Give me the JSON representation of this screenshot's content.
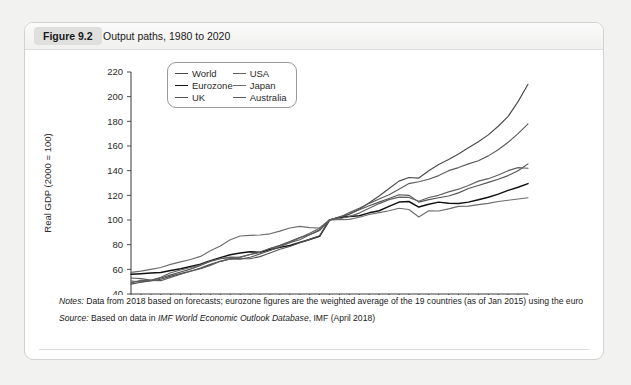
{
  "figure": {
    "badge": "Figure 9.2",
    "title": "Output paths, 1980 to 2020"
  },
  "notes": {
    "notes_label": "Notes:",
    "notes_text": " Data from 2018 based on forecasts; eurozone figures are the weighted average of the 19 countries (as of Jan 2015) using the euro",
    "source_label": "Source:",
    "source_prefix": " Based on data in ",
    "source_italic": "IMF World Economic Outlook Database",
    "source_suffix": ", IMF (April 2018)"
  },
  "chart_data": {
    "type": "line",
    "title": "Output paths, 1980 to 2020",
    "xlabel": "",
    "ylabel": "Real GDP (2000 = 100)",
    "xlim": [
      1980,
      2020
    ],
    "ylim": [
      40,
      220
    ],
    "yticks": [
      40,
      60,
      80,
      100,
      120,
      140,
      160,
      180,
      200,
      220
    ],
    "xticks": [
      1980,
      1985,
      1990,
      1995,
      2000,
      2005,
      2010,
      2015,
      2020
    ],
    "x_minor_step": 1,
    "grid": false,
    "legend_position": "top-left",
    "x": [
      1980,
      1981,
      1982,
      1983,
      1984,
      1985,
      1986,
      1987,
      1988,
      1989,
      1990,
      1991,
      1992,
      1993,
      1994,
      1995,
      1996,
      1997,
      1998,
      1999,
      2000,
      2001,
      2002,
      2003,
      2004,
      2005,
      2006,
      2007,
      2008,
      2009,
      2010,
      2011,
      2012,
      2013,
      2014,
      2015,
      2016,
      2017,
      2018,
      2019,
      2020
    ],
    "series": [
      {
        "name": "World",
        "color": "#4a4a4a",
        "width": 1.15,
        "values": [
          48,
          49.5,
          50.5,
          52,
          54.5,
          56.5,
          58.5,
          61,
          64,
          66.5,
          68.5,
          70,
          72,
          73.8,
          76.8,
          79.5,
          82.6,
          85.8,
          88,
          91.5,
          100,
          102.2,
          104.6,
          108.8,
          114,
          119.5,
          125.5,
          131.5,
          134.5,
          134,
          140,
          145,
          149,
          153.5,
          158.5,
          163.5,
          169,
          176,
          184,
          196,
          210
        ]
      },
      {
        "name": "Eurozone",
        "color": "#111111",
        "width": 1.5,
        "values": [
          56,
          56.5,
          57,
          57.5,
          59,
          60.5,
          62.3,
          64.2,
          67,
          69.5,
          71.8,
          73.3,
          74.3,
          73.8,
          75.8,
          77.8,
          79.3,
          81.7,
          84.2,
          86.8,
          100,
          102,
          102.8,
          103.5,
          105.8,
          107.5,
          111,
          114.5,
          115,
          110.5,
          112.8,
          114.5,
          113.5,
          113.3,
          114.5,
          116.5,
          118.5,
          121,
          124,
          126.5,
          129.5
        ]
      },
      {
        "name": "UK",
        "color": "#555555",
        "width": 1.15,
        "values": [
          50.5,
          49.8,
          51,
          53,
          55.5,
          57.8,
          60.2,
          63.2,
          66.8,
          68.8,
          69.5,
          68.6,
          68.6,
          70.3,
          73.3,
          76.3,
          78.5,
          81.5,
          84.3,
          87.2,
          100,
          102.6,
          104.9,
          108.3,
          111.5,
          114.5,
          117.5,
          120.5,
          120,
          114.5,
          116.5,
          118,
          119.5,
          122,
          125.5,
          128,
          130.5,
          133,
          136,
          140,
          145.5
        ]
      },
      {
        "name": "USA",
        "color": "#616161",
        "width": 1.15,
        "values": [
          53,
          52.5,
          51.2,
          53.5,
          57.2,
          59.5,
          61.5,
          63.6,
          66.3,
          68.6,
          69.9,
          69.7,
          72,
          74,
          76.9,
          78.9,
          81.8,
          85.5,
          89.3,
          93.4,
          100,
          101,
          102.8,
          105.6,
          109.5,
          113.3,
          116.5,
          118.5,
          118.3,
          115.2,
          118.2,
          120,
          122.8,
          125,
          128,
          131.5,
          133.5,
          136.5,
          140,
          142.5,
          142
        ]
      },
      {
        "name": "Japan",
        "color": "#6d6d6d",
        "width": 1.15,
        "values": [
          57.5,
          58.5,
          60,
          61.5,
          64,
          66,
          68,
          70.5,
          75,
          79,
          84,
          87,
          87.5,
          87.8,
          88.8,
          91,
          93.5,
          94.8,
          93.8,
          93.5,
          100,
          100.3,
          100.5,
          102.2,
          104.5,
          106,
          107.5,
          109.5,
          108.5,
          102.5,
          107.5,
          107.3,
          109,
          111,
          111.3,
          112.5,
          113.5,
          115,
          116,
          117,
          118
        ]
      },
      {
        "name": "Australia",
        "color": "#5c5c5c",
        "width": 1.15,
        "values": [
          49,
          51,
          51,
          50.8,
          53.5,
          56,
          58.5,
          60.5,
          63.2,
          66.5,
          68.5,
          68.3,
          69.8,
          72.5,
          75.3,
          78.3,
          81.5,
          84,
          88,
          92,
          100,
          102,
          106,
          109.5,
          113.5,
          117,
          120.5,
          125,
          129.5,
          131,
          133,
          136,
          140,
          142.5,
          145.5,
          148,
          152,
          157,
          163,
          170,
          178
        ]
      }
    ]
  }
}
